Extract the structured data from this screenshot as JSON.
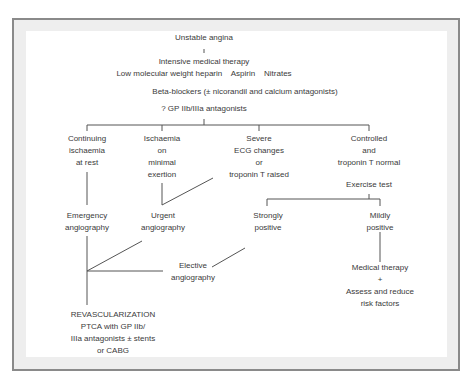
{
  "diagram": {
    "root": "Unstable angina",
    "therapy": {
      "title": "Intensive medical therapy",
      "line1": "Low molecular weight heparin    Aspirin    Nitrates",
      "line2": "Beta-blockers (± nicorandil and calcium antagonists)",
      "line3": "? GP IIb/IIIa antagonists"
    },
    "branches": [
      {
        "lines": [
          "Continuing",
          "ischaemia",
          "at rest"
        ]
      },
      {
        "lines": [
          "Ischaemia",
          "on",
          "minimal",
          "exertion"
        ]
      },
      {
        "lines": [
          "Severe",
          "ECG changes",
          "or",
          "troponin T raised"
        ]
      },
      {
        "lines": [
          "Controlled",
          "and",
          "troponin T normal"
        ]
      }
    ],
    "exercise_test": "Exercise test",
    "emergency": [
      "Emergency",
      "angiography"
    ],
    "urgent": [
      "Urgent",
      "angiography"
    ],
    "strongly": [
      "Strongly",
      "positive"
    ],
    "mildly": [
      "Mildly",
      "positive"
    ],
    "elective": [
      "Elective",
      "angiography"
    ],
    "medical": [
      "Medical therapy",
      "+",
      "Assess and reduce",
      "risk factors"
    ],
    "revasc": [
      "REVASCULARIZATION",
      "PTCA with GP IIb/",
      "IIIa antagonists ± stents",
      "or CABG"
    ]
  },
  "colors": {
    "line": "#555555",
    "frame_border": "#8a8a8a",
    "frame_band": "#eeeeee",
    "text": "#3a3a3a"
  }
}
